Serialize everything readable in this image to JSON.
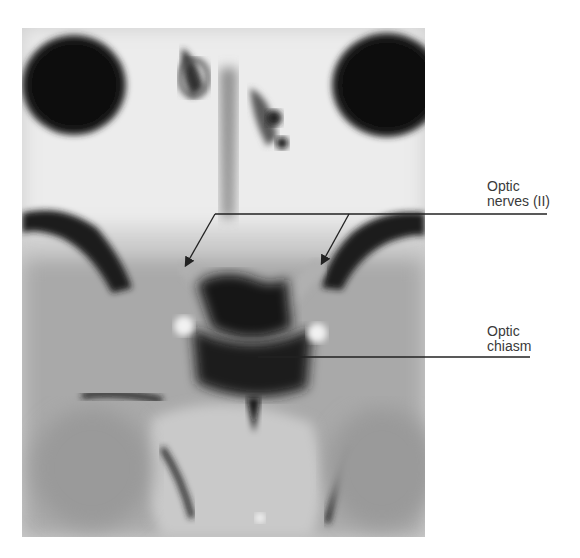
{
  "figure": {
    "type": "MRI scan, coronal/axial view of orbits and skull base",
    "background_color": "#ffffff",
    "image_tones": {
      "dark": "#111111",
      "mid": "#8a8a8a",
      "light": "#e6e6e6"
    }
  },
  "annotations": [
    {
      "id": "optic-nerves",
      "text": "Optic\nnerves (II)",
      "line_color": "#222222"
    },
    {
      "id": "optic-chiasm",
      "text": "Optic\nchiasm",
      "line_color": "#222222"
    }
  ]
}
